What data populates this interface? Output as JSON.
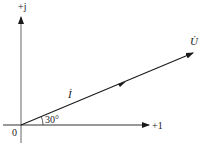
{
  "diagram": {
    "type": "phasor-diagram",
    "axes": {
      "real_label": "+1",
      "imag_label": "+j",
      "origin_label": "0"
    },
    "phasors": [
      {
        "name": "current",
        "label": "İ",
        "angle_deg": 30
      },
      {
        "name": "voltage",
        "label": "U̇",
        "angle_deg": 30
      }
    ],
    "angle_label": "30°",
    "colors": {
      "axis": "#555555",
      "vector": "#1a1a1a"
    }
  }
}
